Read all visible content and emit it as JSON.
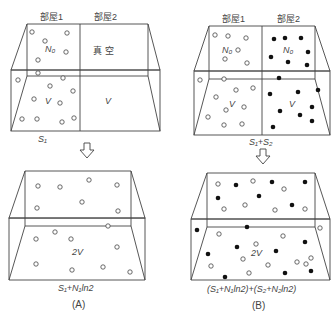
{
  "panelA": {
    "room1_label": "部屋1",
    "room2_label": "部屋2",
    "n0_label": "N₀",
    "vacuum_label": "真 空",
    "v_label_1": "V",
    "v_label_2": "V",
    "entropy_before": "S₁",
    "volume_after": "2V",
    "entropy_after": "S₁+N₁ln2",
    "caption": "(A)"
  },
  "panelB": {
    "room1_label": "部屋1",
    "room2_label": "部屋2",
    "n0_label_1": "N₀",
    "n0_label_2": "N₀",
    "v_label_1": "V",
    "v_label_2": "V",
    "entropy_before": "S₁+S₂",
    "volume_after": "2V",
    "entropy_after": "(S₁+N₁ln2)+(S₂+N₂ln2)",
    "caption": "(B)"
  },
  "arrow_icon": "down-arrow-outline",
  "colors": {
    "line": "#444444",
    "open_particle": "#ffffff",
    "filled_particle": "#111111"
  }
}
